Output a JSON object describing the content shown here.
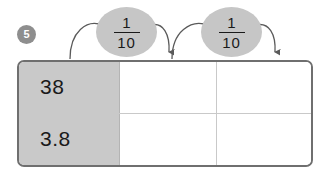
{
  "question": {
    "number": "5"
  },
  "operations": [
    {
      "name": "multiply-by-one-tenth",
      "numerator": "1",
      "denominator": "10",
      "arrow": "curved-arrow-right"
    },
    {
      "name": "multiply-by-one-tenth",
      "numerator": "1",
      "denominator": "10",
      "arrow": "curved-arrow-right"
    }
  ],
  "grid": {
    "rows": [
      {
        "label": "38",
        "cells": [
          "",
          ""
        ]
      },
      {
        "label": "3.8",
        "cells": [
          "",
          ""
        ]
      }
    ]
  },
  "colors": {
    "badge_fill": "#8e8e8e",
    "badge_text": "#ffffff",
    "bubble_fill": "#c6c6c6",
    "label_cell_fill": "#c9c9c9",
    "grid_border": "#6f6f6f",
    "grid_inner_line": "#c9c9c9",
    "arrow_stroke": "#5a5a5a",
    "text": "#1a1a1a"
  }
}
